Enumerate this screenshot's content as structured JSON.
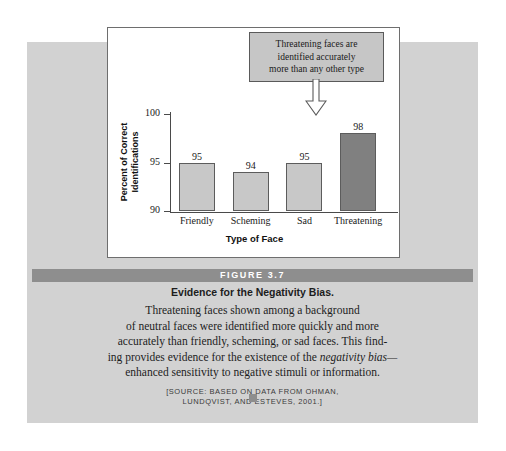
{
  "figure": {
    "banner_label": "FIGURE 3.7",
    "caption_title": "Evidence for the Negativity Bias.",
    "caption_lines": [
      "Threatening faces shown among a background",
      "of neutral faces were identified more quickly and more",
      "accurately than friendly, scheming, or sad faces. This find-"
    ],
    "caption_line_4_pre": "ing provides evidence for the existence of the ",
    "caption_line_4_italic": "negativity bias—",
    "caption_line_5": "enhanced sensitivity to negative stimuli or information.",
    "source_lines": [
      "[SOURCE: BASED ON DATA FROM OHMAN,",
      "LUNDQVIST, AND ESTEVES, 2001.]"
    ]
  },
  "callout": {
    "lines": [
      "Threatening faces are",
      "identified accurately",
      "more than any other type"
    ],
    "arrow_icon": "arrow-down-icon"
  },
  "colors": {
    "page_background": "#ffffff",
    "figure_panel": "#d2d2d2",
    "chart_panel": "#ffffff",
    "bar_light": "#c8c8c8",
    "bar_dark": "#808080",
    "bar_border": "#5c5c5c",
    "axis": "#4a4a4a",
    "banner": "#8e8e8e",
    "callout_fill": "#c6c6c6",
    "callout_border": "#5a5a5a"
  },
  "chart_data": {
    "type": "bar",
    "title": "",
    "xlabel": "Type of Face",
    "ylabel": "Percent of Correct Identifications",
    "ylabel_lines": [
      "Percent of Correct",
      "Identifications"
    ],
    "categories": [
      "Friendly",
      "Scheming",
      "Sad",
      "Threatening"
    ],
    "values": [
      95,
      94,
      95,
      98
    ],
    "value_labels": [
      "95",
      "94",
      "95",
      "98"
    ],
    "ylim": [
      90,
      100
    ],
    "yticks": [
      90,
      95,
      100
    ],
    "ytick_labels": [
      "90",
      "95",
      "100"
    ],
    "grid": false,
    "legend": false,
    "bar_colors": [
      "#c8c8c8",
      "#c8c8c8",
      "#c8c8c8",
      "#808080"
    ],
    "annotation": "Threatening faces are identified accurately more than any other type"
  }
}
